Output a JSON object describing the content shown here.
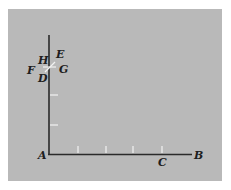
{
  "diagram": {
    "background_color": "#b9b9b9",
    "axis_color": "#2a2a2a",
    "tick_color": "#f2f2f2",
    "labels": {
      "A": "A",
      "B": "B",
      "C": "C",
      "D": "D",
      "E": "E",
      "F": "F",
      "G": "G",
      "H": "H"
    },
    "horizontal_ticks_count": 4,
    "vertical_ticks_count": 2
  }
}
